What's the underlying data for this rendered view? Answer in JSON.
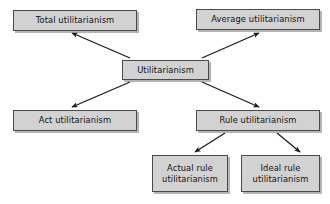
{
  "diagram": {
    "type": "hierarchy-tree",
    "style": {
      "node_fill": "#d2d2d2",
      "node_border": "#4a4a4a",
      "shadow": "#787878",
      "arrow_color": "#1a1a1a",
      "background": "#ffffff"
    },
    "nodes": [
      {
        "id": "total",
        "label": "Total utilitarianism",
        "x": 13,
        "y": 10,
        "w": 124,
        "h": 21
      },
      {
        "id": "average",
        "label": "Average utilitarianism",
        "x": 196,
        "y": 9,
        "w": 124,
        "h": 21
      },
      {
        "id": "utilitarianism",
        "label": "Utilitarianism",
        "x": 122,
        "y": 60,
        "w": 87,
        "h": 20
      },
      {
        "id": "act",
        "label": "Act utilitarianism",
        "x": 13,
        "y": 110,
        "w": 124,
        "h": 21
      },
      {
        "id": "rule",
        "label": "Rule utilitarianism",
        "x": 196,
        "y": 110,
        "w": 124,
        "h": 21
      },
      {
        "id": "actual-rule",
        "label": "Actual rule\nutilitarianism",
        "x": 152,
        "y": 155,
        "w": 76,
        "h": 37
      },
      {
        "id": "ideal-rule",
        "label": "Ideal rule\nutilitarianism",
        "x": 241,
        "y": 155,
        "w": 79,
        "h": 37
      }
    ],
    "edges": [
      {
        "id": "utilitarianism-to-total",
        "from": "utilitarianism",
        "to": "total",
        "x1": 130,
        "y1": 58,
        "x2": 72,
        "y2": 33
      },
      {
        "id": "utilitarianism-to-average",
        "from": "utilitarianism",
        "to": "average",
        "x1": 202,
        "y1": 58,
        "x2": 259,
        "y2": 33
      },
      {
        "id": "utilitarianism-to-act",
        "from": "utilitarianism",
        "to": "act",
        "x1": 130,
        "y1": 82,
        "x2": 72,
        "y2": 107
      },
      {
        "id": "utilitarianism-to-rule",
        "from": "utilitarianism",
        "to": "rule",
        "x1": 202,
        "y1": 82,
        "x2": 259,
        "y2": 107
      },
      {
        "id": "rule-to-actual-rule",
        "from": "rule",
        "to": "actual-rule",
        "x1": 225,
        "y1": 133,
        "x2": 195,
        "y2": 152
      },
      {
        "id": "rule-to-ideal-rule",
        "from": "rule",
        "to": "ideal-rule",
        "x1": 277,
        "y1": 133,
        "x2": 300,
        "y2": 152
      }
    ]
  }
}
